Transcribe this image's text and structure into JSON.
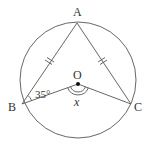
{
  "diagram": {
    "type": "circle-geometry",
    "colors": {
      "stroke": "#555555",
      "text": "#333333",
      "background": "#ffffff"
    },
    "circle": {
      "center_label": "O",
      "cx": 78,
      "cy": 80,
      "r": 58
    },
    "points": {
      "A": {
        "label": "A",
        "x": 77,
        "y": 23
      },
      "B": {
        "label": "B",
        "x": 22,
        "y": 104
      },
      "C": {
        "label": "C",
        "x": 131,
        "y": 104
      },
      "O": {
        "label": "O",
        "x": 78,
        "y": 84
      }
    },
    "segments": [
      "AB",
      "AC",
      "BO",
      "OC"
    ],
    "equal_marks": {
      "description": "AB = AC (double tick marks)",
      "segments": [
        "AB",
        "AC"
      ]
    },
    "angles": {
      "ABO": {
        "label": "35°",
        "value_degrees": 35
      },
      "BOC": {
        "label": "x",
        "unknown": true,
        "marked": "double arc"
      }
    }
  }
}
